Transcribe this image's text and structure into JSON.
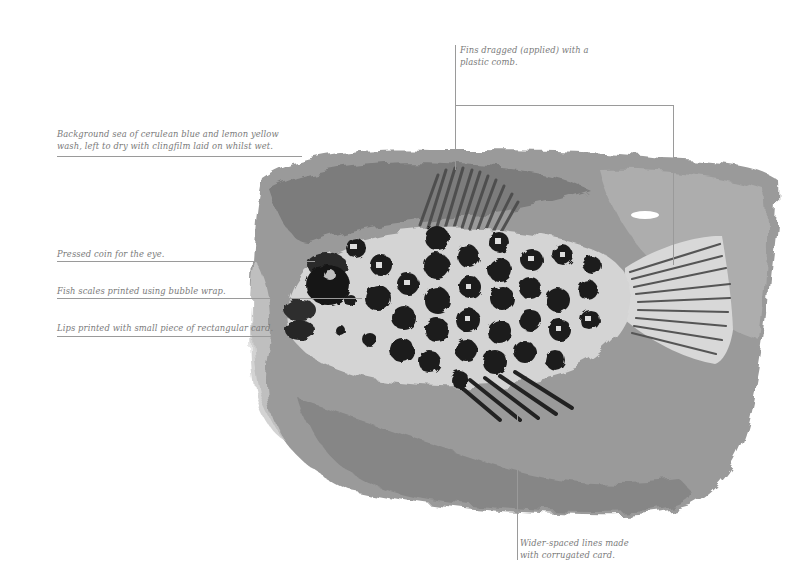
{
  "artwork": {
    "subject": "Monoprinted fish on textured sea background",
    "palette": {
      "background": "#ffffff",
      "sea": "#8d8d8d",
      "sea_dark": "#5e5e5e",
      "fish_body": "#cfcfcf",
      "scales": "#1c1c1c",
      "leader_line": "#9a9a9a",
      "label_text": "#7a7a7a"
    }
  },
  "annotations": {
    "fins_top": {
      "line1": "Fins dragged (applied) with a",
      "line2": "plastic comb."
    },
    "background": {
      "line1": "Background sea of cerulean blue and lemon yellow",
      "line2": "wash, left to dry with clingfilm laid on whilst wet."
    },
    "eye": {
      "line1": "Pressed coin for the eye."
    },
    "scales": {
      "line1": "Fish scales printed using bubble wrap."
    },
    "lips": {
      "line1": "Lips printed with small piece of rectangular card."
    },
    "fins_bottom": {
      "line1": "Wider-spaced lines made",
      "line2": "with corrugated card."
    }
  }
}
